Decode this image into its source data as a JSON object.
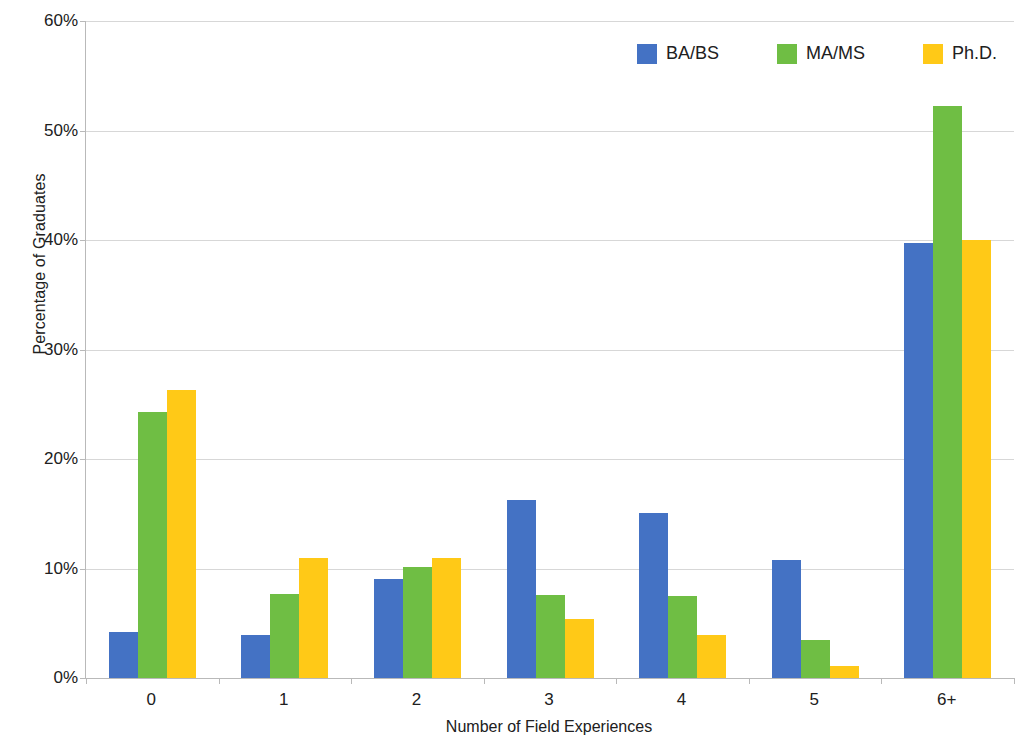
{
  "chart_data": {
    "type": "bar",
    "title": "",
    "xlabel": "Number of Field Experiences",
    "ylabel": "Percentage of Graduates",
    "categories": [
      "0",
      "1",
      "2",
      "3",
      "4",
      "5",
      "6+"
    ],
    "series": [
      {
        "name": "BA/BS",
        "color": "#4472C4",
        "values": [
          4.2,
          3.9,
          9.0,
          16.3,
          15.1,
          10.8,
          39.7
        ]
      },
      {
        "name": "MA/MS",
        "color": "#6FBE44",
        "values": [
          24.3,
          7.7,
          10.1,
          7.6,
          7.5,
          3.5,
          52.2
        ]
      },
      {
        "name": "Ph.D.",
        "color": "#FFC917",
        "values": [
          26.3,
          11.0,
          11.0,
          5.4,
          3.9,
          1.1,
          40.0
        ]
      }
    ],
    "ylim": [
      0,
      60
    ],
    "ytick_values": [
      0,
      10,
      20,
      30,
      40,
      50,
      60
    ],
    "ytick_labels": [
      "0%",
      "10%",
      "20%",
      "30%",
      "40%",
      "50%",
      "60%"
    ],
    "grid": true,
    "legend_position": "top-right",
    "legend_entries": [
      "BA/BS",
      "MA/MS",
      "Ph.D."
    ],
    "colors": {
      "ba_bs": "#4472C4",
      "ma_ms": "#6FBE44",
      "phd": "#FFC917",
      "gridline": "#d7d7d7",
      "axis": "#b9b9b9",
      "background": "#ffffff",
      "text": "#202020"
    }
  }
}
